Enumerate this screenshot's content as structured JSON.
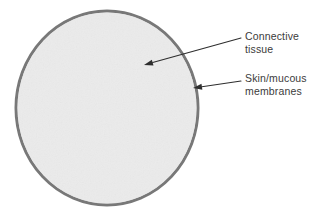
{
  "figure": {
    "canvas": {
      "width": 321,
      "height": 214,
      "background_color": "#ffffff"
    },
    "shape": {
      "name": "body-cross-section-ellipse",
      "type": "ellipse",
      "center_x": 107,
      "center_y": 108,
      "radius_x": 91,
      "radius_y": 97,
      "fill_color": "#ebebeb",
      "stroke_color": "#787878",
      "stroke_width": 3
    },
    "annotations": [
      {
        "id": "connective-tissue",
        "label": "Connective\ntissue",
        "text_color": "#3b3b3b",
        "text_x": 245,
        "text_y": 30,
        "arrow": {
          "name": "connective-tissue-arrow",
          "start_x": 241,
          "start_y": 38,
          "end_x": 144,
          "end_y": 65,
          "color": "#2e2e2e",
          "stroke_width": 1.1,
          "head_length": 9,
          "head_width": 6
        }
      },
      {
        "id": "skin-mucous-membranes",
        "label": "Skin/mucous\nmembranes",
        "text_color": "#3b3b3b",
        "text_x": 245,
        "text_y": 72,
        "arrow": {
          "name": "skin-mucous-membranes-arrow",
          "start_x": 241,
          "start_y": 81,
          "end_x": 193,
          "end_y": 88,
          "color": "#2e2e2e",
          "stroke_width": 1.1,
          "head_length": 9,
          "head_width": 6
        }
      }
    ]
  }
}
